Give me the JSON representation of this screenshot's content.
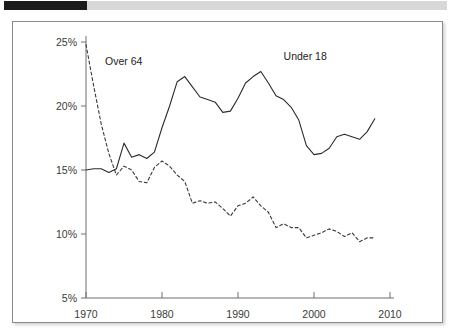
{
  "header": {
    "bar_left_color": "#1b1b1b",
    "bar_right_color": "#d8d8d8"
  },
  "chart_data": {
    "type": "line",
    "title": "",
    "subtitle": "",
    "xlabel": "",
    "ylabel": "",
    "xlim": [
      1970,
      2010
    ],
    "ylim": [
      5,
      25
    ],
    "xticks": [
      1970,
      1980,
      1990,
      2000,
      2010
    ],
    "xtick_labels": [
      "1970",
      "1980",
      "1990",
      "2000",
      "2010"
    ],
    "yticks": [
      5,
      10,
      15,
      20,
      25
    ],
    "ytick_labels": [
      "5%",
      "10%",
      "15%",
      "20%",
      "25%"
    ],
    "grid": false,
    "legend": "inline-annotations",
    "annotations": [
      {
        "text": "Over 64",
        "x": 1972.5,
        "y": 23.2,
        "series": "Over 64"
      },
      {
        "text": "Under 18",
        "x": 1996.0,
        "y": 23.6,
        "series": "Under 18"
      }
    ],
    "series": [
      {
        "name": "Under 18",
        "style": "solid",
        "color": "#2b2b2b",
        "x": [
          1970,
          1971,
          1972,
          1973,
          1974,
          1975,
          1976,
          1977,
          1978,
          1979,
          1980,
          1981,
          1982,
          1983,
          1984,
          1985,
          1986,
          1987,
          1988,
          1989,
          1990,
          1991,
          1992,
          1993,
          1994,
          1995,
          1996,
          1997,
          1998,
          1999,
          2000,
          2001,
          2002,
          2003,
          2004,
          2005,
          2006,
          2007,
          2008
        ],
        "values": [
          15.0,
          15.1,
          15.1,
          14.8,
          15.1,
          17.1,
          16.0,
          16.2,
          15.9,
          16.4,
          18.3,
          20.0,
          21.9,
          22.3,
          21.5,
          20.7,
          20.5,
          20.3,
          19.5,
          19.6,
          20.6,
          21.8,
          22.3,
          22.7,
          21.8,
          20.8,
          20.5,
          19.9,
          18.9,
          16.9,
          16.2,
          16.3,
          16.7,
          17.6,
          17.8,
          17.6,
          17.4,
          18.0,
          19.0
        ]
      },
      {
        "name": "Over 64",
        "style": "dashed",
        "color": "#3a3a3a",
        "x": [
          1970,
          1971,
          1972,
          1973,
          1974,
          1975,
          1976,
          1977,
          1978,
          1979,
          1980,
          1981,
          1982,
          1983,
          1984,
          1985,
          1986,
          1987,
          1988,
          1989,
          1990,
          1991,
          1992,
          1993,
          1994,
          1995,
          1996,
          1997,
          1998,
          1999,
          2000,
          2001,
          2002,
          2003,
          2004,
          2005,
          2006,
          2007,
          2008
        ],
        "values": [
          24.8,
          21.6,
          18.6,
          16.3,
          14.6,
          15.3,
          15.0,
          14.1,
          14.0,
          15.2,
          15.7,
          15.3,
          14.6,
          14.1,
          12.4,
          12.6,
          12.4,
          12.5,
          12.0,
          11.4,
          12.2,
          12.4,
          12.9,
          12.2,
          11.7,
          10.5,
          10.8,
          10.5,
          10.5,
          9.7,
          9.9,
          10.1,
          10.4,
          10.2,
          9.8,
          10.1,
          9.4,
          9.7,
          9.7
        ]
      }
    ]
  }
}
